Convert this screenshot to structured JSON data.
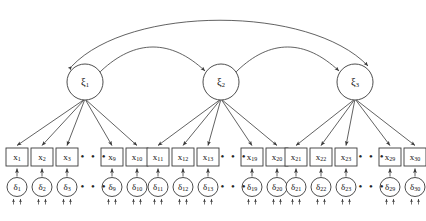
{
  "diagram": {
    "type": "sem-path-diagram",
    "background_color": "#ffffff",
    "stroke_color": "#3a3a3a",
    "text_color": "#111111",
    "ellipsis": "• • •",
    "latents": [
      {
        "id": "xi1",
        "symbol": "ξ",
        "subscript": "1",
        "cx": 85,
        "cy": 82,
        "r": 18
      },
      {
        "id": "xi2",
        "symbol": "ξ",
        "subscript": "2",
        "cx": 221,
        "cy": 82,
        "r": 18
      },
      {
        "id": "xi3",
        "symbol": "ξ",
        "subscript": "3",
        "cx": 355,
        "cy": 82,
        "r": 18
      }
    ],
    "covariances": [
      {
        "id": "cov-xi1-xi2",
        "from": "xi1",
        "to": "xi2",
        "style": "double-headed-curved"
      },
      {
        "id": "cov-xi2-xi3",
        "from": "xi2",
        "to": "xi3",
        "style": "double-headed-curved"
      },
      {
        "id": "cov-xi1-xi3",
        "from": "xi1",
        "to": "xi3",
        "style": "double-headed-curved-wide"
      }
    ],
    "groups": [
      {
        "id": "group1",
        "latent": "xi1",
        "indicators": [
          {
            "symbol": "x",
            "subscript": "1",
            "x": 17,
            "error_symbol": "δ",
            "error_subscript": "1"
          },
          {
            "symbol": "x",
            "subscript": "2",
            "x": 42,
            "error_symbol": "δ",
            "error_subscript": "2"
          },
          {
            "symbol": "x",
            "subscript": "3",
            "x": 67,
            "error_symbol": "δ",
            "error_subscript": "3"
          },
          {
            "symbol": "x",
            "subscript": "9",
            "x": 112,
            "error_symbol": "δ",
            "error_subscript": "9"
          },
          {
            "symbol": "x",
            "subscript": "10",
            "x": 137,
            "error_symbol": "δ",
            "error_subscript": "10"
          }
        ],
        "ellipsis_x": 94
      },
      {
        "id": "group2",
        "latent": "xi2",
        "indicators": [
          {
            "symbol": "x",
            "subscript": "11",
            "x": 158,
            "error_symbol": "δ",
            "error_subscript": "11"
          },
          {
            "symbol": "x",
            "subscript": "12",
            "x": 183,
            "error_symbol": "δ",
            "error_subscript": "12"
          },
          {
            "symbol": "x",
            "subscript": "13",
            "x": 208,
            "error_symbol": "δ",
            "error_subscript": "13"
          },
          {
            "symbol": "x",
            "subscript": "19",
            "x": 252,
            "error_symbol": "δ",
            "error_subscript": "19"
          },
          {
            "symbol": "x",
            "subscript": "20",
            "x": 277,
            "error_symbol": "δ",
            "error_subscript": "20"
          }
        ],
        "ellipsis_x": 234
      },
      {
        "id": "group3",
        "latent": "xi3",
        "indicators": [
          {
            "symbol": "x",
            "subscript": "21",
            "x": 296,
            "error_symbol": "δ",
            "error_subscript": "21"
          },
          {
            "symbol": "x",
            "subscript": "22",
            "x": 321,
            "error_symbol": "δ",
            "error_subscript": "22"
          },
          {
            "symbol": "x",
            "subscript": "23",
            "x": 346,
            "error_symbol": "δ",
            "error_subscript": "23"
          },
          {
            "symbol": "x",
            "subscript": "29",
            "x": 390,
            "error_symbol": "δ",
            "error_subscript": "29"
          },
          {
            "symbol": "x",
            "subscript": "30",
            "x": 415,
            "error_symbol": "δ",
            "error_subscript": "30"
          }
        ],
        "ellipsis_x": 372
      }
    ],
    "geometry": {
      "box_width": 22,
      "box_height": 18,
      "box_y": 148,
      "error_cx_offset": 0,
      "error_cy": 187,
      "error_rx": 10,
      "error_ry": 9.5,
      "loading_arrow": "latent-to-indicator",
      "error_arrow": "error-to-indicator",
      "residual_tick_arrows": 2
    }
  }
}
